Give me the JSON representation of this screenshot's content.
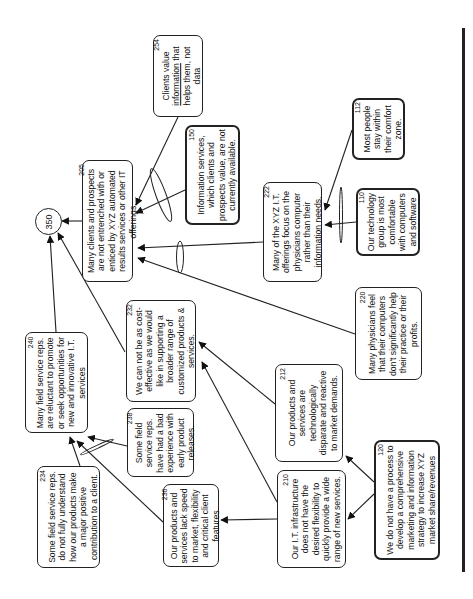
{
  "diagram": {
    "orientation": "rotated 90 degrees counter-clockwise",
    "root": {
      "id": "350",
      "label": "350"
    },
    "nodes": [
      {
        "id": "205",
        "ref": "205",
        "text": "Many clients and prospects are not entrenched with or enticed by XYZ automated results services or other IT offerings."
      },
      {
        "id": "254",
        "ref": "254",
        "text_before": "Clients value ",
        "text_underlined": "information",
        "text_after": " that helps them, not data"
      },
      {
        "id": "150",
        "ref": "150",
        "text": "Information services, which clients and prospects value, are not currently available."
      },
      {
        "id": "222",
        "ref": "222",
        "text": "Many of the XYZ I.T. offerings focus on the physicians computer rather than their information needs."
      },
      {
        "id": "112",
        "ref": "112",
        "text": "Most people stay within their comfort zone."
      },
      {
        "id": "110",
        "ref": "110",
        "text": "Our technology group is most comfortable with computers and software"
      },
      {
        "id": "220",
        "ref": "220",
        "text": "Many physicians feel that their computers don't significantly help their practice or their profits."
      },
      {
        "id": "232",
        "ref": "232",
        "text": "We can not be as cost-effective as we would like in supporting a broader range of customized products & services."
      },
      {
        "id": "240",
        "ref": "240",
        "text": "Many field service reps. are reluctant to promote or seek opportunities for new and innovative I.T. services"
      },
      {
        "id": "238",
        "ref": "238",
        "text": "Some field service reps. have had a bad experience with early product releases."
      },
      {
        "id": "212",
        "ref": "212",
        "text": "Our products and services are technologically disparate and reactive to market demands."
      },
      {
        "id": "234",
        "ref": "234",
        "text": "Some field service reps. do not fully understand how our products make a major positive contribution to a client."
      },
      {
        "id": "236",
        "ref": "236",
        "text": "Our products and services lack speed to market, flexibility and critical client features"
      },
      {
        "id": "210",
        "ref": "210",
        "text": "Our I.T. infrastructure does not have the desired flexibility to quickly provide a wide range of new services."
      },
      {
        "id": "120",
        "ref": "120",
        "text": "We do not have a process to develop a comprehensive marketing and information strategy to increase XYZ market share/revenues"
      }
    ],
    "edges": [
      {
        "from": "205",
        "to": "350"
      },
      {
        "from": "240",
        "to": "350"
      },
      {
        "from": "232",
        "to": "350"
      },
      {
        "from": "254",
        "to": "205",
        "and_group": "A"
      },
      {
        "from": "150",
        "to": "205",
        "and_group": "A"
      },
      {
        "from": "222",
        "to": "205",
        "and_group": "B"
      },
      {
        "from": "220",
        "to": "205",
        "and_group": "B"
      },
      {
        "from": "112",
        "to": "222",
        "and_group": "C"
      },
      {
        "from": "110",
        "to": "222",
        "and_group": "C"
      },
      {
        "from": "212",
        "to": "232"
      },
      {
        "from": "210",
        "to": "232"
      },
      {
        "from": "238",
        "to": "240",
        "and_group": "D"
      },
      {
        "from": "234",
        "to": "240",
        "and_group": "D"
      },
      {
        "from": "236",
        "to": "240"
      },
      {
        "from": "210",
        "to": "236"
      },
      {
        "from": "120",
        "to": "212"
      },
      {
        "from": "120",
        "to": "210"
      }
    ]
  }
}
